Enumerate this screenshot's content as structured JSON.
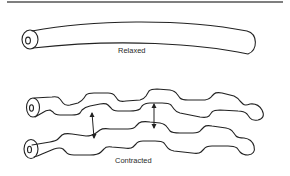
{
  "figure": {
    "labels": {
      "relaxed": "Relaxed",
      "contracted": "Contracted"
    },
    "elements": [
      "top-rule",
      "relaxed-fiber",
      "contracted-fiber-upper",
      "contracted-fiber-lower",
      "distance-arrow-left",
      "distance-arrow-right"
    ],
    "colors": {
      "ink": "#222222",
      "background": "#ffffff"
    }
  }
}
